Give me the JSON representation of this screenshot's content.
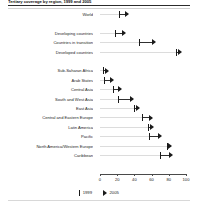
{
  "chart_data": {
    "type": "scatter",
    "title": "Tertiary coverage by region, 1999 and 2005",
    "xlabel": "",
    "ylabel": "",
    "xlim": [
      0,
      100
    ],
    "grid": true,
    "legend_position": "bottom",
    "categories": [
      "World",
      "",
      "Developing countries",
      "Countries in transition",
      "Developed countries",
      "",
      "Sub-Saharan Africa",
      "Arab States",
      "Central Asia",
      "South and West Asia",
      "East Asia",
      "Central and Eastern Europe",
      "Latin America",
      "Pacific",
      "North America/Western Europe",
      "Caribbean"
    ],
    "series": [
      {
        "name": "1999",
        "marker": "vertical-bar",
        "values": [
          22,
          null,
          18,
          45,
          88,
          null,
          3,
          5,
          15,
          21,
          40,
          49,
          56,
          57,
          78,
          70
        ]
      },
      {
        "name": "2005",
        "marker": "arrow-right",
        "values": [
          32,
          null,
          28,
          63,
          93,
          null,
          8,
          14,
          24,
          38,
          44,
          60,
          61,
          70,
          82,
          83
        ]
      }
    ],
    "xticks": [
      0,
      20,
      40,
      60,
      80,
      100
    ],
    "xticklabels": [
      "0",
      "20",
      "40",
      "60",
      "80",
      "100"
    ],
    "legend": [
      {
        "label": "1999",
        "marker": "vertical-bar"
      },
      {
        "label": "2005",
        "marker": "arrow-right"
      }
    ]
  },
  "axis": {
    "min": 0,
    "max": 100
  }
}
